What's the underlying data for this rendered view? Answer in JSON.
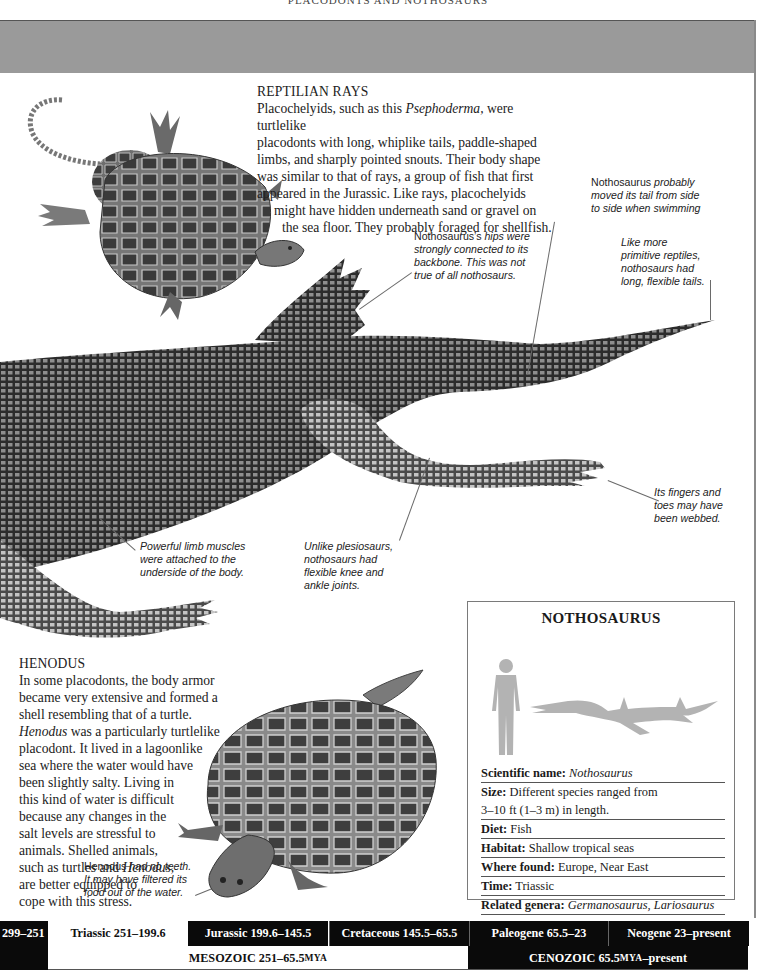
{
  "page": {
    "running_head": "PLACODONTS AND NOTHOSAURS"
  },
  "reptilian_rays": {
    "heading": "REPTILIAN RAYS",
    "lines": [
      [
        "Placochelyids, such as this ",
        "Psephoderma,",
        " were turtlelike"
      ],
      [
        "placodonts with long, whiplike tails, paddle-shaped"
      ],
      [
        "limbs, and sharply pointed snouts. Their body shape"
      ],
      [
        "was similar to that of rays, a group of fish that first"
      ],
      [
        "appeared in the Jurassic. Like rays, placochelyids"
      ],
      [
        "might have hidden underneath sand or gravel on"
      ],
      [
        "the sea floor. They probably foraged for shellfish."
      ]
    ]
  },
  "captions": {
    "tail_swim": {
      "plain1": "Nothosaurus",
      "italic1": " probably",
      "line2": "moved its tail from side",
      "line3": "to side when swimming"
    },
    "hips": {
      "plain1": "Nothosaurus’s",
      "italic1": " hips were",
      "line2": "strongly connected to its",
      "line3": "backbone. This was not",
      "line4": "true of all nothosaurs."
    },
    "tails": {
      "line1": "Like more",
      "line2": "primitive reptiles,",
      "line3": "nothosaurs had",
      "line4": "long, flexible tails."
    },
    "fingers": {
      "line1": "Its fingers and",
      "line2": "toes may have",
      "line3": "been webbed."
    },
    "limb_muscles": {
      "line1": "Powerful limb muscles",
      "line2": "were attached to the",
      "line3": "underside of the body."
    },
    "knee": {
      "line1": "Unlike plesiosaurs,",
      "line2": "nothosaurs had",
      "line3": "flexible knee and",
      "line4": "ankle joints."
    },
    "teeth": {
      "plain1": "Henodus",
      "italic1": " had no teeth.",
      "line2": "It may have filtered its",
      "line3": "food out of the water."
    }
  },
  "henodus": {
    "heading": "HENODUS",
    "lines": [
      [
        "In some placodonts, the body armor"
      ],
      [
        "became very extensive and formed a"
      ],
      [
        "shell resembling that of a turtle."
      ],
      [
        "",
        "Henodus",
        " was a particularly turtlelike"
      ],
      [
        "placodont. It lived in a lagoonlike"
      ],
      [
        "sea where the water would have"
      ],
      [
        "been slightly salty. Living in"
      ],
      [
        "this kind of water is difficult"
      ],
      [
        "because any changes in the"
      ],
      [
        "salt levels are stressful to"
      ],
      [
        "animals. Shelled animals,"
      ],
      [
        "such as turtles and ",
        "Henodus,",
        ""
      ],
      [
        "are better equipped to"
      ],
      [
        "cope with this stress."
      ]
    ]
  },
  "factbox": {
    "title": "NOTHOSAURUS",
    "rows": [
      {
        "label": "Scientific name:",
        "value": "Nothosaurus",
        "italic": true
      },
      {
        "label": "Size:",
        "value": "Different species ranged from",
        "italic": false
      },
      {
        "label": "",
        "value": "3–10 ft (1–3 m) in length.",
        "italic": false
      },
      {
        "label": "Diet:",
        "value": "Fish",
        "italic": false
      },
      {
        "label": "Habitat:",
        "value": "Shallow tropical seas",
        "italic": false
      },
      {
        "label": "Where found:",
        "value": "Europe, Near East",
        "italic": false
      },
      {
        "label": "Time:",
        "value": "Triassic",
        "italic": false
      },
      {
        "label": "Related genera:",
        "value": "Germanosaurus, Lariosaurus",
        "italic": true
      }
    ],
    "silhouette_color": "#b3b3b3"
  },
  "timeline": {
    "periods": [
      {
        "label": "299–251",
        "style": "black"
      },
      {
        "label": "Triassic 251–199.6",
        "style": "white"
      },
      {
        "label": "Jurassic 199.6–145.5",
        "style": "black"
      },
      {
        "label": "Cretaceous 145.5–65.5",
        "style": "black"
      },
      {
        "label": "Paleogene 65.5–23",
        "style": "black"
      },
      {
        "label": "Neogene 23–present",
        "style": "black"
      }
    ],
    "eras": {
      "mesozoic": {
        "name": "MESOZOIC 251–65.5 ",
        "unit": "MYA"
      },
      "cenozoic": {
        "name": "CENOZOIC 65.5 ",
        "unit": "MYA",
        "suffix": "–present"
      }
    }
  }
}
